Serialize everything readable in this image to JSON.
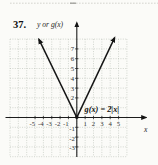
{
  "figure": {
    "problem_number": "37."
  },
  "chart": {
    "y_axis_title": "y or g(x)",
    "x_axis_title": "x",
    "equation_label": "g(x) = 2|x|"
  },
  "chart_data": {
    "type": "line",
    "function": "g(x) = 2|x|",
    "series": [
      {
        "name": "g(x) = 2|x|",
        "points": [
          [
            -4.7,
            9.4
          ],
          [
            -4,
            8
          ],
          [
            -3,
            6
          ],
          [
            -2,
            4
          ],
          [
            -1,
            2
          ],
          [
            0,
            0
          ],
          [
            1,
            2
          ],
          [
            2,
            4
          ],
          [
            3,
            6
          ],
          [
            4,
            8
          ],
          [
            4.7,
            9.4
          ]
        ],
        "style": "V-shape, solid black, arrowheads on both upper ends, solid dot at vertex (0,0)"
      }
    ],
    "x_tick_labels": [
      "-5",
      "-4",
      "-3",
      "-2",
      "-1",
      "1",
      "2",
      "3",
      "4",
      "5"
    ],
    "y_tick_labels_positive": [
      "7",
      "6",
      "5",
      "4",
      "3",
      "2"
    ],
    "y_tick_labels_negative": [
      "-1",
      "-2",
      "-3"
    ],
    "xlabel": "x",
    "ylabel": "y or g(x)",
    "xlim": [
      -8,
      6
    ],
    "ylim": [
      -4,
      8
    ],
    "grid": true,
    "legend": false
  },
  "colors": {
    "axis": "#1c1c1c",
    "curve": "#141414",
    "grid": "#b7bdb4",
    "paper": "#fbfbf8",
    "artifact_line": "#cfcfca"
  }
}
